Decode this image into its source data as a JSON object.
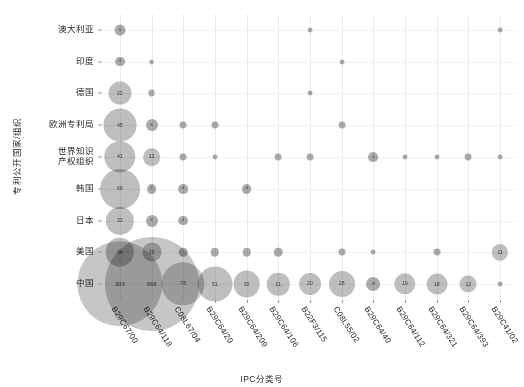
{
  "chart_data": {
    "type": "scatter",
    "title": "",
    "xlabel": "IPC分类号",
    "ylabel": "专利公开国家/组织",
    "grid": true,
    "legend": "none",
    "categories": [
      "B29C67/00",
      "B29C64/118",
      "C08L67/04",
      "B29C64/20",
      "B29C64/209",
      "B29C64/106",
      "B22F3/115",
      "C08L55/02",
      "B29C64/40",
      "B29C64/112",
      "B29C64/321",
      "B29C64/393",
      "B29C41/02"
    ],
    "y_categories": [
      "澳大利亚",
      "印度",
      "德国",
      "欧洲专利局",
      "世界知识\n产权组织",
      "韩国",
      "日本",
      "美国",
      "中国"
    ],
    "series": [
      {
        "name": "澳大利亚",
        "values": [
          5,
          null,
          null,
          null,
          null,
          null,
          1,
          null,
          null,
          null,
          null,
          null,
          1
        ]
      },
      {
        "name": "印度",
        "values": [
          4,
          1,
          null,
          null,
          null,
          null,
          null,
          1,
          null,
          null,
          null,
          null,
          null
        ]
      },
      {
        "name": "德国",
        "values": [
          22,
          2,
          null,
          null,
          null,
          null,
          1,
          null,
          null,
          null,
          null,
          null,
          null
        ]
      },
      {
        "name": "欧洲专利局",
        "values": [
          45,
          6,
          2,
          2,
          null,
          null,
          null,
          2,
          null,
          null,
          null,
          null,
          null
        ]
      },
      {
        "name": "世界知识\n产权组织",
        "values": [
          41,
          13,
          2,
          1,
          null,
          2,
          2,
          null,
          4,
          1,
          1,
          2,
          1
        ]
      },
      {
        "name": "韩国",
        "values": [
          66,
          4,
          4,
          null,
          4,
          null,
          null,
          null,
          null,
          null,
          null,
          null,
          null
        ]
      },
      {
        "name": "日本",
        "values": [
          33,
          6,
          4,
          null,
          null,
          null,
          null,
          null,
          null,
          null,
          null,
          null,
          null
        ]
      },
      {
        "name": "美国",
        "values": [
          34,
          15,
          3,
          3,
          3,
          3,
          null,
          2,
          1,
          null,
          2,
          null,
          11
        ]
      },
      {
        "name": "中国",
        "values": [
          303,
          368,
          78,
          51,
          30,
          21,
          20,
          28,
          8,
          19,
          18,
          12,
          1
        ]
      }
    ]
  }
}
